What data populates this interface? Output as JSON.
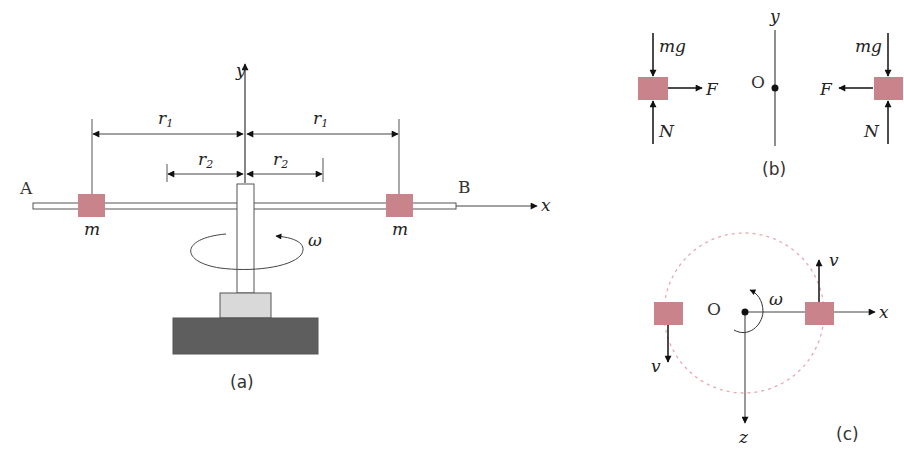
{
  "figure_a": {
    "caption": "(a)",
    "end_left": "A",
    "end_right": "B",
    "axis_x": "x",
    "axis_y": "y",
    "r1_label": "r",
    "r1_sub": "1",
    "r2_label": "r",
    "r2_sub": "2",
    "mass_left": "m",
    "mass_right": "m",
    "omega": "ω"
  },
  "figure_b": {
    "caption": "(b)",
    "axis_y": "y",
    "origin": "O",
    "left": {
      "weight": "mg",
      "normal": "N",
      "force": "F"
    },
    "right": {
      "weight": "mg",
      "normal": "N",
      "force": "F"
    }
  },
  "figure_c": {
    "caption": "(c)",
    "origin": "O",
    "axis_x": "x",
    "axis_z": "z",
    "omega": "ω",
    "velocity_left": "v",
    "velocity_right": "v"
  },
  "colors": {
    "mass": "#c9838a",
    "line": "#444444",
    "arrow": "#111111",
    "base_dark": "#5e5e5e",
    "base_light": "#d9d9d9",
    "circle": "#e6a9b1"
  }
}
